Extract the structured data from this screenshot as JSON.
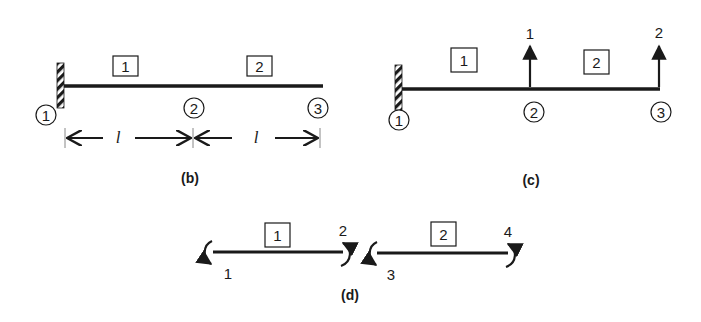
{
  "figures": {
    "b": {
      "caption": "(b)",
      "elements": [
        "1",
        "2"
      ],
      "nodes": [
        "1",
        "2",
        "3"
      ],
      "dimensions": [
        "l",
        "l"
      ]
    },
    "c": {
      "caption": "(c)",
      "elements": [
        "1",
        "2"
      ],
      "nodes": [
        "1",
        "2",
        "3"
      ],
      "dof_labels": [
        "1",
        "2"
      ]
    },
    "d": {
      "caption": "(d)",
      "elements": [
        "1",
        "2"
      ],
      "rotation_dofs": [
        "1",
        "2",
        "3",
        "4"
      ]
    }
  },
  "colors": {
    "ink": "#1a1a1a",
    "background": "#ffffff"
  }
}
